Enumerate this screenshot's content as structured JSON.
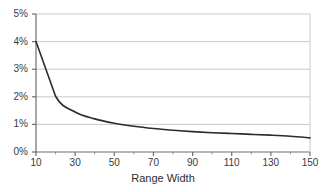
{
  "chart_data": {
    "type": "line",
    "title": "",
    "subtitle": "",
    "xlabel": "Range Width",
    "ylabel": "",
    "xlim": [
      10,
      150
    ],
    "ylim": [
      0,
      5
    ],
    "grid": true,
    "legend": null,
    "y_tick_labels": [
      "0%",
      "1%",
      "2%",
      "3%",
      "4%",
      "5%"
    ],
    "y_ticks": [
      0,
      1,
      2,
      3,
      4,
      5
    ],
    "x_ticks": [
      10,
      30,
      50,
      70,
      90,
      110,
      130,
      150
    ],
    "x_tick_labels": [
      "10",
      "30",
      "50",
      "70",
      "90",
      "110",
      "130",
      "150"
    ],
    "x_minor_ticks": [
      20,
      40,
      60,
      80,
      100,
      120,
      140
    ],
    "series": [
      {
        "name": "",
        "color": "#2b2b2b",
        "x": [
          10,
          20,
          30,
          40,
          50,
          60,
          70,
          80,
          90,
          100,
          110,
          120,
          130,
          140,
          150
        ],
        "values": [
          4.0,
          2.02,
          1.45,
          1.2,
          1.04,
          0.93,
          0.85,
          0.79,
          0.74,
          0.7,
          0.67,
          0.64,
          0.61,
          0.57,
          0.51
        ]
      }
    ],
    "colors": {
      "line": "#2b2b2b",
      "gridline": "#c8c8c8",
      "axis": "#6e6e6e",
      "text": "#3a3a3a",
      "background": "#ffffff"
    }
  },
  "axis_title": {
    "x": "Range Width"
  }
}
